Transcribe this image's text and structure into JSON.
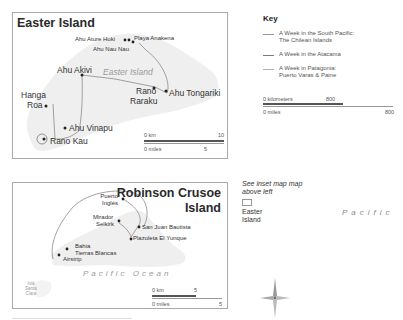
{
  "key": {
    "title": "Key",
    "items": [
      {
        "label_line1": "A Week in the South Pacific:",
        "label_line2": "The Chilean Islands",
        "color": "#9a9a9a"
      },
      {
        "label_line1": "A Week in the Atacama",
        "label_line2": "",
        "color": "#7a7a7a"
      },
      {
        "label_line1": "A Week in Patagonia:",
        "label_line2": "Puerto Varas & Paine",
        "color": "#b0b0b0"
      }
    ],
    "scale": {
      "km_label": "0 kilometers",
      "km_max": "800",
      "mi_label": "0 miles",
      "mi_max": "800"
    }
  },
  "easter_island": {
    "title": "Easter Island",
    "island_label": "Easter Island",
    "places": {
      "ahu_ature_huki": "Ahu Ature Huki",
      "playa_anakena": "Playa Anakena",
      "ahu_nau_nau": "Ahu Nau Nau",
      "ahu_akivi": "Ahu Akivi",
      "rano_raraku_1": "Rano",
      "rano_raraku_2": "Raraku",
      "ahu_tongariki": "Ahu Tongariki",
      "hanga_roa_1": "Hanga",
      "hanga_roa_2": "Roa",
      "ahu_vinapu": "Ahu Vinapu",
      "rano_kau": "Rano Kau"
    },
    "scale": {
      "km_label": "0 km",
      "km_max": "10",
      "mi_label": "0 miles",
      "mi_max": "5"
    }
  },
  "robinson_crusoe": {
    "title_line1": "Robinson Crusoe",
    "title_line2": "Island",
    "ocean_label": "Pacific Ocean",
    "places": {
      "puerto_ingles_1": "Puerto",
      "puerto_ingles_2": "Inglés",
      "mirador_selkirk_1": "Mirador",
      "mirador_selkirk_2": "Selkirk",
      "san_juan_bautista": "San Juan Bautista",
      "plazoleta_el_yunque": "Plazoleta El Yunque",
      "bahia_1": "Bahia",
      "bahia_2": "Tierras Blancas",
      "airstrip": "Airstrip",
      "isla_1": "Isla",
      "isla_2": "Santa",
      "isla_3": "Clara"
    },
    "scale": {
      "km_label": "0 km",
      "km_max": "5",
      "mi_label": "0 miles",
      "mi_max": "5"
    }
  },
  "inset_note": {
    "line1": "See ",
    "line1_it": "inset map",
    "line2": "above left",
    "label_1": "Easter",
    "label_2": "Island"
  },
  "pacific_label": "Pacific",
  "colors": {
    "route": "#8a8a8a",
    "island": "#efefef",
    "frame": "#a8a8a8"
  }
}
